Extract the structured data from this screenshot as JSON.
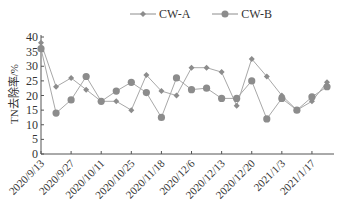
{
  "chart_data": {
    "type": "line",
    "title": "",
    "xlabel": "",
    "ylabel": "TN去除率/%",
    "ylim": [
      0,
      40
    ],
    "yticks": [
      0,
      5,
      10,
      15,
      20,
      25,
      30,
      35,
      40
    ],
    "xtick_labels": [
      "2020/9/13",
      "2020/9/27",
      "2020/10/11",
      "2020/10/25",
      "2020/11/18",
      "2020/12/6",
      "2020/12/13",
      "2020/12/20",
      "2021/1/3",
      "2021/1/17"
    ],
    "grid": false,
    "legend_position": "top",
    "point_count": 20,
    "series": [
      {
        "name": "CW-A",
        "marker": "diamond",
        "color": "#8c8c8c",
        "values": [
          38,
          23,
          26,
          22,
          18,
          18,
          15,
          27,
          21.5,
          20,
          29.5,
          29.5,
          28,
          16.5,
          32.5,
          26.5,
          20,
          15,
          18,
          24.5
        ]
      },
      {
        "name": "CW-B",
        "marker": "circle",
        "color": "#8c8c8c",
        "values": [
          36,
          14,
          18.5,
          26.5,
          18,
          21.5,
          24.5,
          21,
          12.5,
          26,
          22,
          22.5,
          19,
          19,
          25,
          12,
          19,
          15,
          19.5,
          23
        ]
      }
    ]
  },
  "legend": {
    "items": [
      {
        "label": "CW-A",
        "marker": "diamond"
      },
      {
        "label": "CW-B",
        "marker": "circle"
      }
    ]
  }
}
